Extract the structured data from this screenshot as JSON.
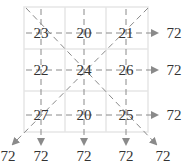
{
  "grid": {
    "rows": [
      [
        23,
        20,
        21
      ],
      [
        22,
        24,
        26
      ],
      [
        27,
        20,
        25
      ]
    ]
  },
  "sums": {
    "rows": [
      "72",
      "72",
      "72"
    ],
    "columns": [
      "72",
      "72",
      "72"
    ],
    "anti_diagonal": "72",
    "main_diagonal": "72"
  },
  "colors": {
    "grid_line": "#e6e6e6",
    "arrow": "#8a8a8a",
    "text": "#333333"
  }
}
